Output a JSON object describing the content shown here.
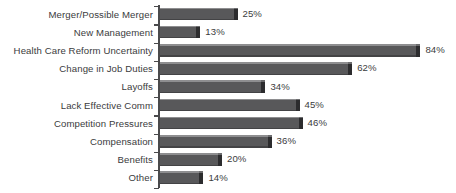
{
  "chart_data": {
    "type": "bar",
    "orientation": "horizontal",
    "title": "",
    "subtitle": "",
    "xlabel": "",
    "ylabel": "",
    "xlim": [
      0,
      90
    ],
    "grid": false,
    "legend": null,
    "value_suffix": "%",
    "categories": [
      "Merger/Possible Merger",
      "New Management",
      "Health Care Reform Uncertainty",
      "Change in Job Duties",
      "Layoffs",
      "Lack Effective Comm",
      "Competition Pressures",
      "Compensation",
      "Benefits",
      "Other"
    ],
    "values": [
      25,
      13,
      84,
      62,
      34,
      45,
      46,
      36,
      20,
      14
    ],
    "value_labels": [
      "25%",
      "13%",
      "84%",
      "62%",
      "34%",
      "45%",
      "46%",
      "36%",
      "20%",
      "14%"
    ],
    "colors": {
      "background": "#ffffff",
      "bar_body": "#58585a",
      "bar_top_highlight": "#8e8e90",
      "bar_bottom_shade": "#434345",
      "bar_end_cap": "#2c2c2e",
      "axis": "#4a4a4c",
      "text": "#3b3b3d"
    }
  }
}
